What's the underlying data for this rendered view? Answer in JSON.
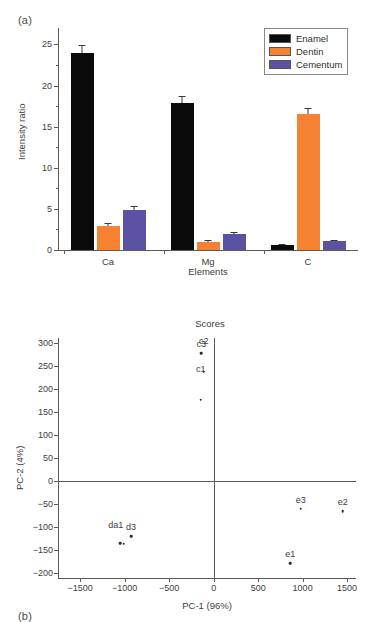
{
  "figure": {
    "panel_a_letter": "(a)",
    "panel_b_letter": "(b)"
  },
  "chart_data": [
    {
      "type": "bar",
      "panel": "(a)",
      "title": "",
      "xlabel": "Elements",
      "ylabel": "Intensity ratio",
      "categories": [
        "Ca",
        "Mg",
        "C"
      ],
      "ylim": [
        0,
        27
      ],
      "yticks": [
        0,
        5,
        10,
        15,
        20,
        25
      ],
      "grid": false,
      "legend_position": "top-right",
      "series": [
        {
          "name": "Enamel",
          "color": "#0a0a0a",
          "values": [
            24.0,
            17.9,
            0.55
          ],
          "errors": [
            0.9,
            0.8,
            0.12
          ]
        },
        {
          "name": "Dentin",
          "color": "#f58233",
          "values": [
            2.95,
            1.0,
            16.5
          ],
          "errors": [
            0.3,
            0.2,
            0.8
          ]
        },
        {
          "name": "Cementum",
          "color": "#5b52a3",
          "values": [
            4.9,
            1.95,
            1.1
          ],
          "errors": [
            0.45,
            0.2,
            0.15
          ]
        }
      ]
    },
    {
      "type": "scatter",
      "panel": "(b)",
      "title": "Scores",
      "xlabel": "PC-1 (96%)",
      "ylabel": "PC-2 (4%)",
      "xlim": [
        -1750,
        1600
      ],
      "ylim": [
        -210,
        310
      ],
      "xticks": [
        -1500,
        -1000,
        -500,
        0,
        500,
        1000,
        1500
      ],
      "yticks": [
        -200,
        -150,
        -100,
        -50,
        0,
        50,
        100,
        150,
        200,
        250,
        300
      ],
      "grid": false,
      "zero_lines": true,
      "points": [
        {
          "label": "c3",
          "x": -140,
          "y": 277,
          "label_dx": 0,
          "label_dy": -4
        },
        {
          "label": "c2",
          "x": -110,
          "y": 237,
          "label_dx": 0,
          "label_dy": -26
        },
        {
          "label": "c1",
          "x": -145,
          "y": 176,
          "label_dx": 0,
          "label_dy": -26
        },
        {
          "label": "e3",
          "x": 980,
          "y": -60,
          "label_dx": 0,
          "label_dy": -4
        },
        {
          "label": "e2",
          "x": 1450,
          "y": -65,
          "label_dx": 0,
          "label_dy": -4
        },
        {
          "label": "e1",
          "x": 860,
          "y": -178,
          "label_dx": 0,
          "label_dy": -4
        },
        {
          "label": "d3",
          "x": -930,
          "y": -120,
          "label_dx": 0,
          "label_dy": -4
        },
        {
          "label": "da1",
          "x": -1010,
          "y": -136,
          "label_dx": -8,
          "label_dy": -14
        },
        {
          "label": "",
          "x": -1050,
          "y": -134,
          "label_dx": 0,
          "label_dy": 0
        }
      ]
    }
  ]
}
